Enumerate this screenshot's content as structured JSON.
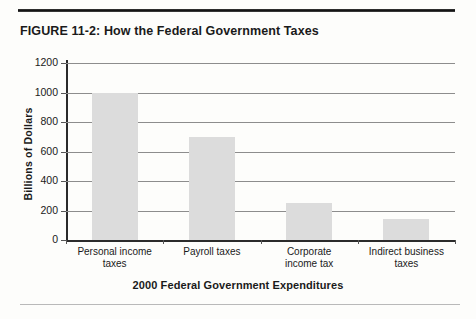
{
  "page": {
    "top_rule": "top-rule",
    "bottom_rule": "bottom-rule"
  },
  "figure": {
    "title": "FIGURE 11-2: How the Federal Government Taxes"
  },
  "chart_data": {
    "type": "bar",
    "title": "FIGURE 11-2: How the Federal Government Taxes",
    "xlabel": "2000 Federal Government Expenditures",
    "ylabel": "Billions of Dollars",
    "categories": [
      "Personal income taxes",
      "Payroll taxes",
      "Corporate income tax",
      "Indirect business taxes"
    ],
    "category_lines": [
      [
        "Personal income",
        "taxes"
      ],
      [
        "Payroll taxes"
      ],
      [
        "Corporate",
        "income tax"
      ],
      [
        "Indirect business",
        "taxes"
      ]
    ],
    "values": [
      1000,
      700,
      250,
      140
    ],
    "ylim": [
      0,
      1200
    ],
    "ytick_step": 200,
    "yticks": [
      0,
      200,
      400,
      600,
      800,
      1000,
      1200
    ],
    "ytick_labels": [
      "0",
      "200",
      "400",
      "600",
      "800",
      "1000",
      "1200"
    ],
    "grid": true,
    "legend": "none",
    "bar_color": "#dcdcdc",
    "axis_color": "#2b2b2b",
    "gridline_color": "#8d8d8d"
  }
}
